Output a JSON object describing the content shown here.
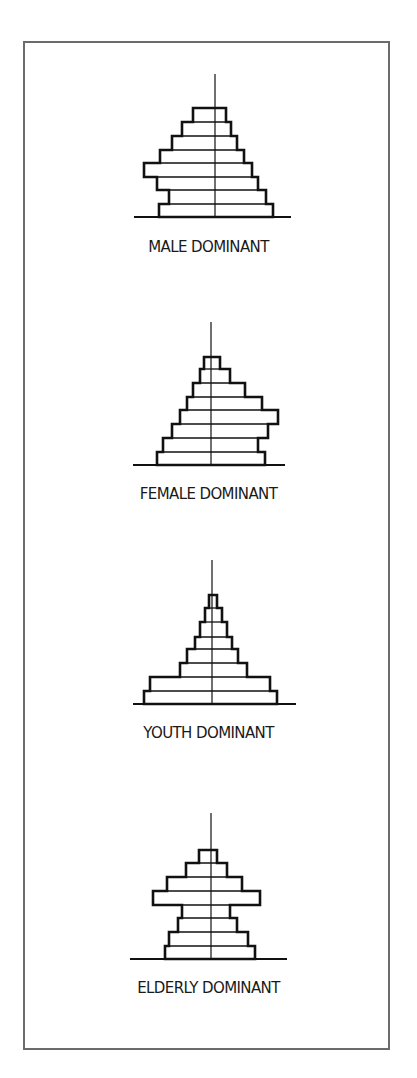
{
  "figure": {
    "frame_color": "#6b6b6b",
    "line_color": "#111111",
    "panels": [
      {
        "id": "male",
        "label": "MALE DOMINANT"
      },
      {
        "id": "female",
        "label": "FEMALE DOMINANT"
      },
      {
        "id": "youth",
        "label": "YOUTH DOMINANT"
      },
      {
        "id": "elderly",
        "label": "ELDERLY DOMINANT"
      }
    ]
  },
  "chart_data": [
    {
      "type": "bar",
      "title": "MALE DOMINANT",
      "orientation": "population-pyramid",
      "axis_x": 215,
      "axis_top": 74,
      "baseline_y": 217,
      "baseline_x": [
        134,
        291
      ],
      "label_y": 238,
      "bars": [
        {
          "top": 108,
          "left": 193,
          "right": 226
        },
        {
          "top": 122,
          "left": 182,
          "right": 231
        },
        {
          "top": 136,
          "left": 172,
          "right": 237
        },
        {
          "top": 150,
          "left": 160,
          "right": 244
        },
        {
          "top": 163,
          "left": 144,
          "right": 252
        },
        {
          "top": 177,
          "left": 157,
          "right": 258
        },
        {
          "top": 190,
          "left": 169,
          "right": 266
        },
        {
          "top": 204,
          "left": 159,
          "right": 273
        }
      ]
    },
    {
      "type": "bar",
      "title": "FEMALE DOMINANT",
      "orientation": "population-pyramid",
      "axis_x": 211,
      "axis_top": 322,
      "baseline_y": 465,
      "baseline_x": [
        133,
        285
      ],
      "label_y": 485,
      "bars": [
        {
          "top": 357,
          "left": 204,
          "right": 220
        },
        {
          "top": 369,
          "left": 200,
          "right": 230
        },
        {
          "top": 383,
          "left": 193,
          "right": 245
        },
        {
          "top": 397,
          "left": 187,
          "right": 262
        },
        {
          "top": 410,
          "left": 180,
          "right": 278
        },
        {
          "top": 424,
          "left": 172,
          "right": 268
        },
        {
          "top": 438,
          "left": 163,
          "right": 258
        },
        {
          "top": 452,
          "left": 157,
          "right": 265
        }
      ]
    },
    {
      "type": "bar",
      "title": "YOUTH DOMINANT",
      "orientation": "population-pyramid",
      "axis_x": 212,
      "axis_top": 560,
      "baseline_y": 704,
      "baseline_x": [
        133,
        296
      ],
      "label_y": 724,
      "bars": [
        {
          "top": 595,
          "left": 209,
          "right": 217
        },
        {
          "top": 608,
          "left": 205,
          "right": 222
        },
        {
          "top": 622,
          "left": 200,
          "right": 227
        },
        {
          "top": 637,
          "left": 195,
          "right": 232
        },
        {
          "top": 649,
          "left": 187,
          "right": 238
        },
        {
          "top": 663,
          "left": 180,
          "right": 247
        },
        {
          "top": 677,
          "left": 150,
          "right": 270
        },
        {
          "top": 691,
          "left": 144,
          "right": 277
        }
      ]
    },
    {
      "type": "bar",
      "title": "ELDERLY DOMINANT",
      "orientation": "population-pyramid",
      "axis_x": 211,
      "axis_top": 813,
      "baseline_y": 959,
      "baseline_x": [
        130,
        287
      ],
      "label_y": 979,
      "bars": [
        {
          "top": 850,
          "left": 199,
          "right": 217
        },
        {
          "top": 863,
          "left": 186,
          "right": 227
        },
        {
          "top": 877,
          "left": 167,
          "right": 242
        },
        {
          "top": 891,
          "left": 153,
          "right": 260
        },
        {
          "top": 905,
          "left": 182,
          "right": 230
        },
        {
          "top": 918,
          "left": 178,
          "right": 237
        },
        {
          "top": 932,
          "left": 169,
          "right": 248
        },
        {
          "top": 946,
          "left": 165,
          "right": 255
        }
      ]
    }
  ]
}
